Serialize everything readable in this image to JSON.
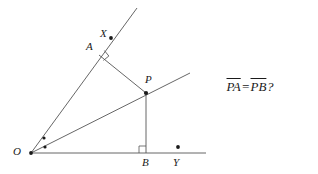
{
  "figure": {
    "background_color": "#ffffff",
    "stroke_color": "#555555",
    "label_color": "#1a1a1a"
  },
  "points": [
    {
      "id": "O",
      "label": "O",
      "x": 31,
      "y": 153,
      "label_x": 13,
      "label_y": 146,
      "dot": true
    },
    {
      "id": "X",
      "label": "X",
      "x": 111,
      "y": 38,
      "label_x": 100,
      "label_y": 28,
      "dot": true
    },
    {
      "id": "A",
      "label": "A",
      "x": 99,
      "y": 55,
      "label_x": 86,
      "label_y": 41,
      "dot": false
    },
    {
      "id": "P",
      "label": "P",
      "x": 146,
      "y": 93,
      "label_x": 145,
      "label_y": 74,
      "dot": true
    },
    {
      "id": "B",
      "label": "B",
      "x": 146,
      "y": 153,
      "label_x": 142,
      "label_y": 157,
      "dot": false
    },
    {
      "id": "Y",
      "label": "Y",
      "x": 178,
      "y": 147,
      "label_x": 173,
      "label_y": 157,
      "dot": true
    }
  ],
  "lines": [
    {
      "id": "ray-OX",
      "name": "upper-ray-through-X",
      "x1": 31,
      "y1": 153,
      "x2": 137,
      "y2": 8
    },
    {
      "id": "ray-OP",
      "name": "bisector-ray-through-P",
      "x1": 31,
      "y1": 153,
      "x2": 190,
      "y2": 73
    },
    {
      "id": "ray-OY",
      "name": "baseline-ray-through-Y",
      "x1": 31,
      "y1": 153,
      "x2": 206,
      "y2": 153
    },
    {
      "id": "seg-AP",
      "name": "perpendicular-A-to-P",
      "x1": 99,
      "y1": 55,
      "x2": 146,
      "y2": 93
    },
    {
      "id": "seg-PB",
      "name": "perpendicular-P-to-B",
      "x1": 146,
      "y1": 93,
      "x2": 146,
      "y2": 153
    }
  ],
  "angle_marks": [
    {
      "id": "angle-dot-upper",
      "name": "equal-angle-dot-upper",
      "x": 44,
      "y": 138
    },
    {
      "id": "angle-dot-lower",
      "name": "equal-angle-dot-lower",
      "x": 45,
      "y": 147
    }
  ],
  "right_angles": [
    {
      "id": "right-angle-A",
      "name": "right-angle-mark-at-A",
      "x": 99,
      "y": 55,
      "rotation": -39,
      "size": 6
    },
    {
      "id": "right-angle-B",
      "name": "right-angle-mark-at-B",
      "x": 146,
      "y": 153,
      "rotation": 0,
      "size": 7
    }
  ],
  "annotation": {
    "segment_1": "PA",
    "equals": "=",
    "segment_2": "PB",
    "question_mark": "?",
    "full_text": "PA=PB?"
  }
}
